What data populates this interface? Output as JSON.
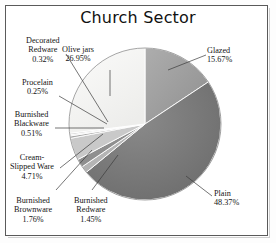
{
  "figure": {
    "title": "Church Sector"
  },
  "chart_data": {
    "type": "pie",
    "title": "Church Sector",
    "xlabel": "",
    "ylabel": "",
    "legend": "none",
    "grid": false,
    "value_unit": "percent",
    "categories": [
      "Glazed",
      "Plain",
      "Burnished Redware",
      "Burnished Brownware",
      "Cream-Slipped Ware",
      "Burnished Blackware",
      "Procelain",
      "Decorated Redware",
      "Olive jars"
    ],
    "values": [
      15.67,
      48.37,
      1.45,
      1.76,
      4.71,
      0.51,
      0.25,
      0.32,
      26.95
    ],
    "slices": [
      {
        "label": "Glazed",
        "value": 15.67,
        "value_text": "15.67%",
        "color": "#9a9a9a"
      },
      {
        "label": "Plain",
        "value": 48.37,
        "value_text": "48.37%",
        "color": "#6e6e6e"
      },
      {
        "label": "Burnished Redware",
        "value": 1.45,
        "value_text": "1.45%",
        "color": "#b4b4b4"
      },
      {
        "label": "Burnished Brownware",
        "value": 1.76,
        "value_text": "1.76%",
        "color": "#8f8f8f"
      },
      {
        "label": "Cream-Slipped Ware",
        "value": 4.71,
        "value_text": "4.71%",
        "color": "#c9c9c9"
      },
      {
        "label": "Burnished Blackware",
        "value": 0.51,
        "value_text": "0.51%",
        "color": "#a8a8a8"
      },
      {
        "label": "Procelain",
        "value": 0.25,
        "value_text": "0.25%",
        "color": "#d2d2d2"
      },
      {
        "label": "Decorated Redware",
        "value": 0.32,
        "value_text": "0.32%",
        "color": "#bdbdbd"
      },
      {
        "label": "Olive jars",
        "value": 26.95,
        "value_text": "26.95%",
        "color": "#f4f4f2"
      }
    ],
    "start_angle_deg": 0,
    "direction": "clockwise"
  },
  "labels": {
    "decorated_redware": {
      "name": "Decorated",
      "name2": "Redware",
      "pct": "0.32%"
    },
    "olive_jars": {
      "name": "Olive jars",
      "pct": "26.95%"
    },
    "glazed": {
      "name": "Glazed",
      "pct": "15.67%"
    },
    "porcelain": {
      "name": "Procelain",
      "pct": "0.25%"
    },
    "burnished_blackware": {
      "name": "Burnished",
      "name2": "Blackware",
      "pct": "0.51%"
    },
    "cream_slipped": {
      "name": "Cream-",
      "name2": "Slipped Ware",
      "pct": "4.71%"
    },
    "burnished_brownware": {
      "name": "Burnished",
      "name2": "Brownware",
      "pct": "1.76%"
    },
    "burnished_redware": {
      "name": "Burnished",
      "name2": "Redware",
      "pct": "1.45%"
    },
    "plain": {
      "name": "Plain",
      "pct": "48.37%"
    }
  }
}
